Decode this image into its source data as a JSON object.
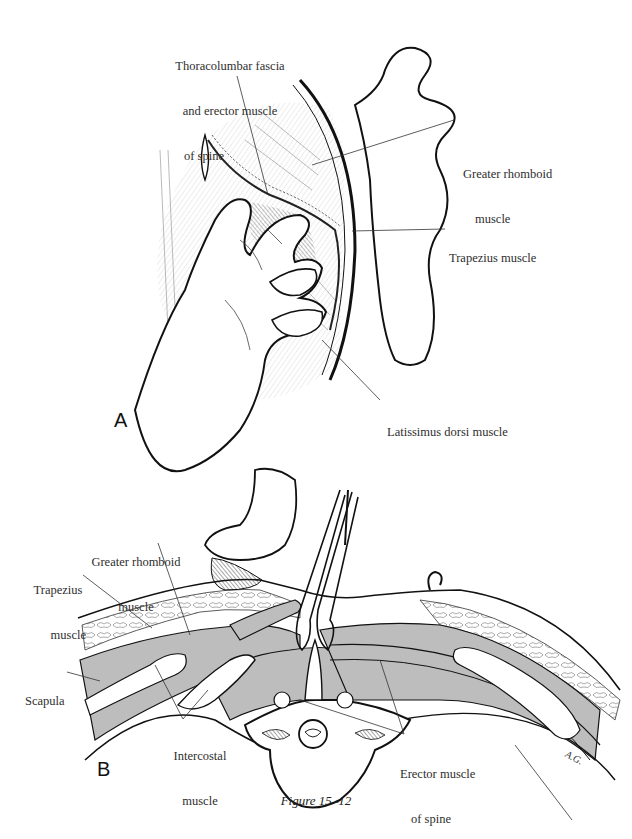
{
  "figure": {
    "caption": "Figure 15–12",
    "artist_signature": "A.G.",
    "colors": {
      "ink": "#1a1a1a",
      "muscle_fill": "#bdbdbd",
      "background": "#ffffff",
      "label_text": "#2e2e2e"
    },
    "panels": [
      {
        "id": "A",
        "letter": "A",
        "labels": [
          {
            "name": "thoracolumbar-fascia-label",
            "lines": [
              "Thoracolumbar fascia",
              "and erector muscle",
              "of spine"
            ]
          },
          {
            "name": "greater-rhomboid-label",
            "lines": [
              "Greater rhomboid",
              "muscle"
            ]
          },
          {
            "name": "trapezius-label",
            "lines": [
              "Trapezius muscle"
            ]
          },
          {
            "name": "latissimus-dorsi-label",
            "lines": [
              "Latissimus dorsi muscle"
            ]
          }
        ]
      },
      {
        "id": "B",
        "letter": "B",
        "labels": [
          {
            "name": "greater-rhomboid-label",
            "lines": [
              "Greater rhomboid",
              "muscle"
            ]
          },
          {
            "name": "trapezius-label",
            "lines": [
              "Trapezius",
              "muscle"
            ]
          },
          {
            "name": "scapula-label",
            "lines": [
              "Scapula"
            ]
          },
          {
            "name": "intercostal-label",
            "lines": [
              "Intercostal",
              "muscle"
            ]
          },
          {
            "name": "erector-spine-label",
            "lines": [
              "Erector muscle",
              "of spine"
            ]
          }
        ]
      }
    ]
  }
}
